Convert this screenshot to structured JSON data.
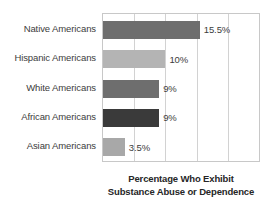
{
  "chart_data": {
    "type": "bar",
    "orientation": "horizontal",
    "title": "",
    "categories": [
      "Native Americans",
      "Hispanic Americans",
      "White Americans",
      "African Americans",
      "Asian Americans"
    ],
    "values": [
      15.5,
      10,
      9,
      9,
      3.5
    ],
    "value_labels": [
      "15.5%",
      "10%",
      "9%",
      "9%",
      "3.5%"
    ],
    "bar_colors": [
      "#6e6e6e",
      "#b4b4b4",
      "#6e6e6e",
      "#3a3a3a",
      "#a8a8a8"
    ],
    "xlabel": "Percentage Who Exhibit Substance Abuse or Dependence",
    "ylabel": "",
    "xlim": [
      0,
      25
    ],
    "gridline_values": [
      0,
      5,
      10,
      15,
      20,
      25
    ],
    "grid": true,
    "tick_labels_visible": false,
    "legend": null,
    "legend_position": "none"
  },
  "caption": {
    "line1": "Percentage Who Exhibit",
    "line2": "Substance Abuse or Dependence"
  },
  "colors": {
    "plot_border": "#c8c8c8",
    "gridline": "#d2d2d2",
    "label_text": "#3c3c3c",
    "caption_text": "#262626",
    "background": "#ffffff"
  }
}
